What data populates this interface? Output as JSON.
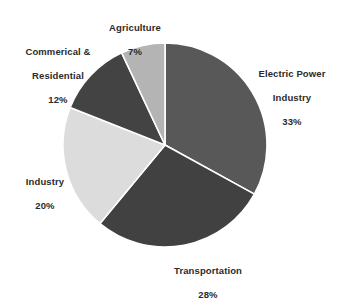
{
  "chart_data": {
    "type": "pie",
    "title": "",
    "subtitle": "",
    "xlabel": "",
    "ylabel": "",
    "legend_position": "none",
    "grid": false,
    "units": "percent",
    "categories": [
      "Electric Power Industry",
      "Transportation",
      "Industry",
      "Commerical & Residential",
      "Agriculture"
    ],
    "values": [
      33,
      28,
      20,
      12,
      7
    ],
    "colors": [
      "#585858",
      "#414141",
      "#dcdcdc",
      "#434343",
      "#b4b4b4"
    ],
    "slices": [
      {
        "name": "Electric Power Industry",
        "label_line1": "Electric Power",
        "label_line2": "Industry",
        "percent_label": "33%",
        "value": 33,
        "color": "#585858"
      },
      {
        "name": "Transportation",
        "label_line1": "Transportation",
        "label_line2": "",
        "percent_label": "28%",
        "value": 28,
        "color": "#414141"
      },
      {
        "name": "Industry",
        "label_line1": "Industry",
        "label_line2": "",
        "percent_label": "20%",
        "value": 20,
        "color": "#dcdcdc"
      },
      {
        "name": "Commerical & Residential",
        "label_line1": "Commerical &",
        "label_line2": "Residential",
        "percent_label": "12%",
        "value": 12,
        "color": "#434343"
      },
      {
        "name": "Agriculture",
        "label_line1": "Agriculture",
        "label_line2": "",
        "percent_label": "7%",
        "value": 7,
        "color": "#b4b4b4"
      }
    ],
    "geometry": {
      "center_x": 165,
      "center_y": 145,
      "radius": 102,
      "start_angle_deg": 0,
      "direction": "clockwise"
    },
    "style": {
      "background": "#ffffff",
      "separator_color": "#ffffff",
      "label_color": "#2b2b2b"
    }
  }
}
